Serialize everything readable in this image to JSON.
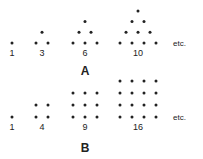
{
  "figure_a": {
    "label": "A",
    "title": "Triangular numbers",
    "items": [
      {
        "value": "1",
        "rows": [
          1
        ]
      },
      {
        "value": "3",
        "rows": [
          1,
          2
        ]
      },
      {
        "value": "6",
        "rows": [
          1,
          2,
          3
        ]
      },
      {
        "value": "10",
        "rows": [
          1,
          2,
          3,
          4
        ]
      }
    ],
    "etc": "etc."
  },
  "figure_b": {
    "label": "B",
    "title": "Square numbers",
    "items": [
      {
        "value": "1",
        "size": 1
      },
      {
        "value": "4",
        "size": 2
      },
      {
        "value": "9",
        "size": 3
      },
      {
        "value": "16",
        "size": 4
      }
    ],
    "etc": "etc."
  },
  "colors": {
    "dot": "#222222",
    "text": "#222222",
    "background": "#ffffff"
  }
}
